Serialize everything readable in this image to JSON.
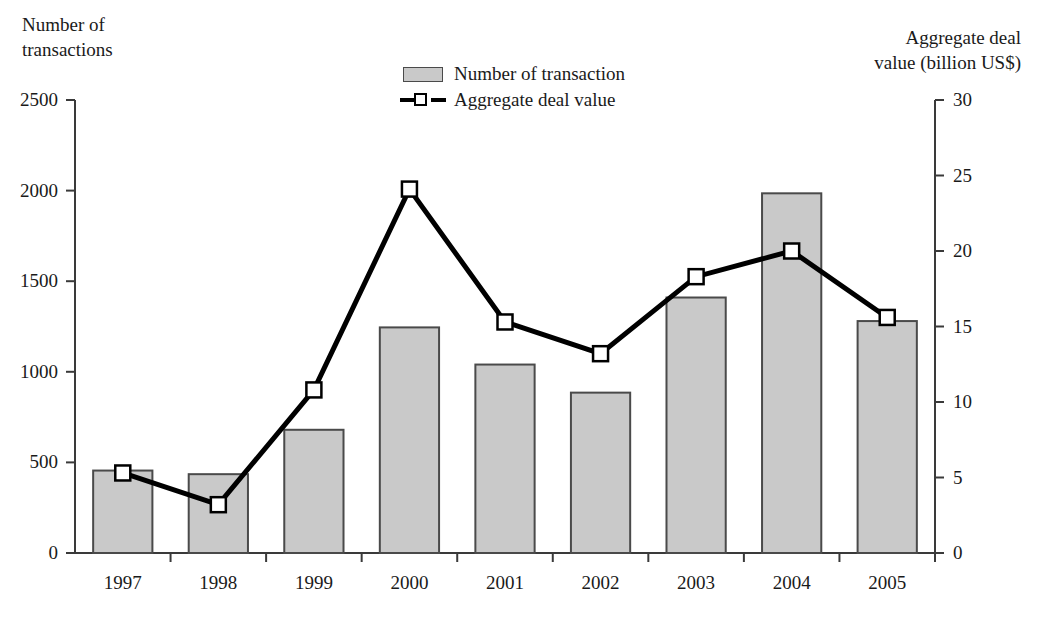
{
  "chart_data": {
    "type": "bar",
    "title": "",
    "subtitle": "",
    "categories": [
      "1997",
      "1998",
      "1999",
      "2000",
      "2001",
      "2002",
      "2003",
      "2004",
      "2005"
    ],
    "xlabel": "",
    "ylabel": "Number of transactions",
    "y2label": "Aggregate deal value (billion US$)",
    "ylim": [
      0,
      2500
    ],
    "y2lim": [
      0,
      30
    ],
    "yticks": [
      "0",
      "500",
      "1000",
      "1500",
      "2000",
      "2500"
    ],
    "ytick_values": [
      0,
      500,
      1000,
      1500,
      2000,
      2500
    ],
    "y2ticks": [
      "0",
      "5",
      "10",
      "15",
      "20",
      "25",
      "30"
    ],
    "y2tick_values": [
      0,
      5,
      10,
      15,
      20,
      25,
      30
    ],
    "grid": false,
    "legend_position": "top-center",
    "series": [
      {
        "name": "Number of transaction",
        "type": "bar",
        "axis": "left",
        "color": "#c9c9c9",
        "edge_color": "#4a4a4a",
        "values": [
          455,
          435,
          680,
          1245,
          1040,
          885,
          1410,
          1985,
          1280
        ]
      },
      {
        "name": "Aggregate deal value",
        "type": "line",
        "axis": "right",
        "color": "#000000",
        "marker": "square-open",
        "values": [
          5.3,
          3.2,
          10.8,
          24.1,
          15.3,
          13.2,
          18.3,
          20.0,
          15.6
        ]
      }
    ]
  },
  "axes": {
    "left_title": "Number of\ntransactions",
    "right_title": "Aggregate deal\nvalue (billion US$)"
  },
  "legend": {
    "items": [
      {
        "label": "Number of transaction",
        "marker": "bar-swatch-icon"
      },
      {
        "label": "Aggregate deal value",
        "marker": "line-square-marker-icon"
      }
    ]
  }
}
